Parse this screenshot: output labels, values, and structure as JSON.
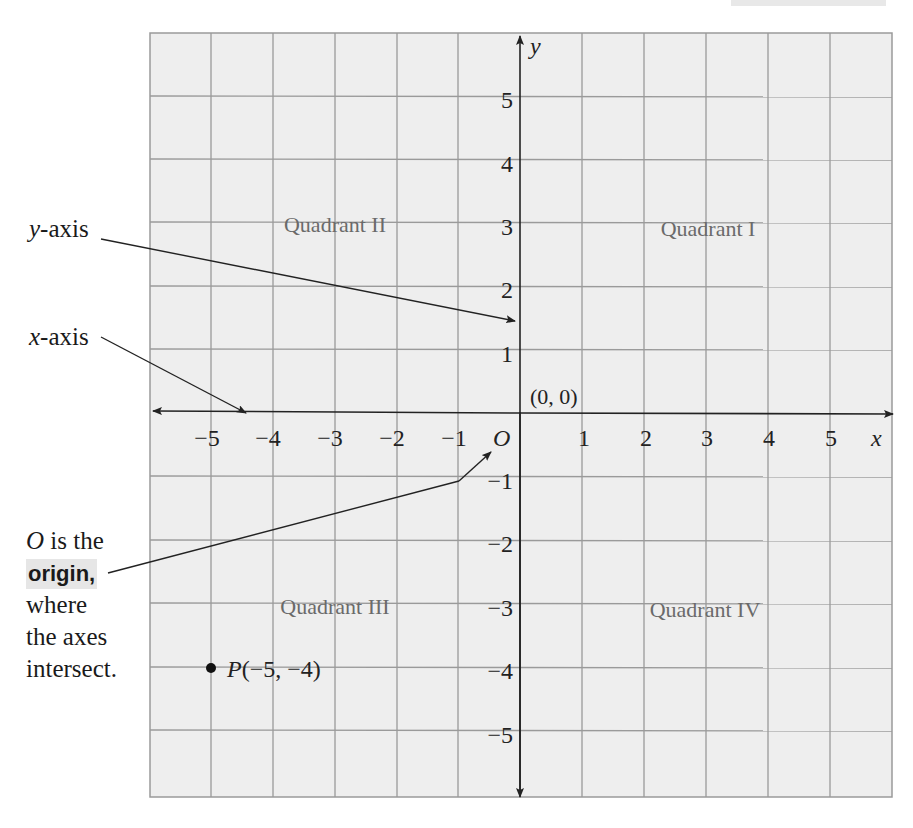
{
  "figure": {
    "x_axis_label": "x",
    "y_axis_label": "y",
    "x_ticks": [
      "−5",
      "−4",
      "−3",
      "−2",
      "−1",
      "1",
      "2",
      "3",
      "4",
      "5"
    ],
    "y_ticks": [
      "5",
      "4",
      "3",
      "2",
      "1",
      "−1",
      "−2",
      "−3",
      "−4",
      "−5"
    ],
    "origin_letter": "O",
    "origin_coords": "(0, 0)",
    "quadrants": {
      "q1": "Quadrant I",
      "q2": "Quadrant II",
      "q3": "Quadrant III",
      "q4": "Quadrant IV"
    },
    "point": {
      "name": "P",
      "coords": "(−5, −4)",
      "x": -5,
      "y": -4
    }
  },
  "callouts": {
    "y_axis": {
      "var": "y",
      "text": "-axis"
    },
    "x_axis": {
      "var": "x",
      "text": "-axis"
    },
    "origin_note": {
      "line1_var": "O",
      "line1_text": " is the",
      "line2_bold": "origin,",
      "line3": "where",
      "line4": "the axes",
      "line5": "intersect."
    }
  },
  "colors": {
    "grid_bg": "#eeeeee",
    "grid_line": "#9a9a9a",
    "axis": "#222222",
    "quadrant_text": "#6a6a6a",
    "highlight": "#e6e6e6"
  }
}
